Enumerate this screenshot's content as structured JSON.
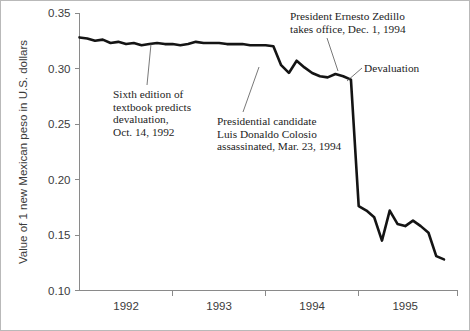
{
  "chart_data": {
    "type": "line",
    "title": "",
    "xlabel": "",
    "ylabel": "Value of 1 new Mexican peso in U.S. dollars",
    "ylim": [
      0.1,
      0.35
    ],
    "ytick_labels": [
      "0.35",
      "0.30",
      "0.25",
      "0.20",
      "0.15",
      "0.10"
    ],
    "ytick_values": [
      0.35,
      0.3,
      0.25,
      0.2,
      0.15,
      0.1
    ],
    "xtick_labels": [
      "1992",
      "1993",
      "1994",
      "1995"
    ],
    "xlim": [
      "1992-01",
      "1995-12"
    ],
    "grid": false,
    "legend": "none",
    "series": [
      {
        "name": "New Mexican peso / U.S. dollar",
        "x": [
          "1992-01",
          "1992-02",
          "1992-03",
          "1992-04",
          "1992-05",
          "1992-06",
          "1992-07",
          "1992-08",
          "1992-09",
          "1992-10",
          "1992-11",
          "1992-12",
          "1993-01",
          "1993-02",
          "1993-03",
          "1993-04",
          "1993-05",
          "1993-06",
          "1993-07",
          "1993-08",
          "1993-09",
          "1993-10",
          "1993-11",
          "1993-12",
          "1994-01",
          "1994-02",
          "1994-03",
          "1994-04",
          "1994-05",
          "1994-06",
          "1994-07",
          "1994-08",
          "1994-09",
          "1994-10",
          "1994-11",
          "1994-12",
          "1995-01",
          "1995-02",
          "1995-03",
          "1995-04",
          "1995-05",
          "1995-06",
          "1995-07",
          "1995-08",
          "1995-09",
          "1995-10",
          "1995-11",
          "1995-12"
        ],
        "values": [
          0.328,
          0.327,
          0.325,
          0.326,
          0.323,
          0.324,
          0.322,
          0.323,
          0.321,
          0.322,
          0.323,
          0.322,
          0.322,
          0.321,
          0.322,
          0.324,
          0.323,
          0.323,
          0.323,
          0.322,
          0.322,
          0.322,
          0.321,
          0.321,
          0.321,
          0.32,
          0.303,
          0.296,
          0.307,
          0.301,
          0.296,
          0.293,
          0.292,
          0.295,
          0.293,
          0.29,
          0.176,
          0.172,
          0.166,
          0.145,
          0.172,
          0.16,
          0.158,
          0.163,
          0.158,
          0.152,
          0.131,
          0.128
        ]
      }
    ],
    "annotations": [
      {
        "name": "textbook-prediction",
        "lines": [
          "Sixth edition of",
          "textbook predicts",
          "devaluation,",
          "Oct. 14, 1992"
        ],
        "target_x": "1992-10",
        "target_value": 0.322
      },
      {
        "name": "colosio-assassination",
        "lines": [
          "Presidential candidate",
          "Luis Donaldo Colosio",
          "assassinated, Mar. 23, 1994"
        ],
        "target_x": "1994-03",
        "target_value": 0.303
      },
      {
        "name": "zedillo-takes-office",
        "lines": [
          "President Ernesto Zedillo",
          "takes office, Dec. 1, 1994"
        ],
        "target_x": "1994-12",
        "target_value": 0.29
      },
      {
        "name": "devaluation",
        "lines": [
          "Devaluation"
        ],
        "target_x": "1994-12",
        "target_value": 0.285
      }
    ]
  }
}
